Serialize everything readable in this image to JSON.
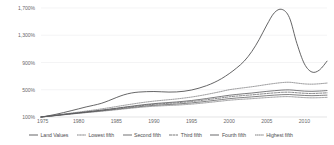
{
  "chart_data": {
    "type": "line",
    "title": "",
    "subtitle": "",
    "xlabel": "",
    "ylabel": "",
    "xlim": [
      1975,
      2013
    ],
    "ylim": [
      100,
      1700
    ],
    "grid": true,
    "legend_position": "bottom",
    "y_ticks": [
      "100%",
      "500%",
      "900%",
      "1,300%",
      "1,700%"
    ],
    "y_tick_values": [
      100,
      500,
      900,
      1300,
      1700
    ],
    "x_ticks": [
      "1975",
      "1980",
      "1985",
      "1990",
      "1995",
      "2000",
      "2005",
      "2010"
    ],
    "x_tick_values": [
      1975,
      1980,
      1985,
      1990,
      1995,
      2000,
      2005,
      2010
    ],
    "x": [
      1975,
      1976,
      1977,
      1978,
      1979,
      1980,
      1981,
      1982,
      1983,
      1984,
      1985,
      1986,
      1987,
      1988,
      1989,
      1990,
      1991,
      1992,
      1993,
      1994,
      1995,
      1996,
      1997,
      1998,
      1999,
      2000,
      2001,
      2002,
      2003,
      2004,
      2005,
      2006,
      2007,
      2008,
      2009,
      2010,
      2011,
      2012,
      2013
    ],
    "series": [
      {
        "name": "Land Values",
        "style": "solid",
        "color": "#4a4a4c",
        "values": [
          100,
          118,
          140,
          165,
          192,
          220,
          248,
          272,
          300,
          340,
          385,
          425,
          452,
          466,
          472,
          474,
          470,
          466,
          468,
          478,
          496,
          524,
          560,
          606,
          664,
          736,
          820,
          920,
          1060,
          1240,
          1450,
          1630,
          1680,
          1560,
          1180,
          880,
          760,
          790,
          920
        ]
      },
      {
        "name": "Lowest fifth",
        "style": "dotted-fine",
        "color": "#6f6f71",
        "values": [
          100,
          110,
          121,
          132,
          143,
          154,
          164,
          174,
          184,
          195,
          206,
          218,
          229,
          240,
          250,
          258,
          264,
          269,
          274,
          281,
          289,
          299,
          310,
          322,
          334,
          346,
          355,
          362,
          369,
          377,
          385,
          392,
          398,
          399,
          392,
          385,
          382,
          384,
          388
        ]
      },
      {
        "name": "Second fifth",
        "style": "solid",
        "color": "#58585a",
        "values": [
          100,
          111,
          122,
          134,
          146,
          157,
          168,
          179,
          190,
          202,
          214,
          227,
          239,
          251,
          262,
          271,
          278,
          284,
          290,
          298,
          307,
          318,
          330,
          343,
          356,
          369,
          379,
          387,
          395,
          404,
          413,
          421,
          428,
          430,
          423,
          416,
          413,
          416,
          421
        ]
      },
      {
        "name": "Third fifth",
        "style": "dashed",
        "color": "#5e5e60",
        "values": [
          100,
          112,
          124,
          137,
          149,
          161,
          173,
          185,
          197,
          210,
          224,
          238,
          251,
          264,
          276,
          286,
          294,
          301,
          308,
          317,
          327,
          339,
          353,
          367,
          381,
          396,
          407,
          416,
          425,
          435,
          445,
          454,
          462,
          464,
          456,
          448,
          445,
          449,
          455
        ]
      },
      {
        "name": "Fourth fifth",
        "style": "solid",
        "color": "#4f4f51",
        "values": [
          100,
          112,
          125,
          138,
          151,
          163,
          176,
          188,
          201,
          215,
          229,
          244,
          258,
          272,
          285,
          296,
          305,
          313,
          321,
          331,
          342,
          356,
          371,
          387,
          403,
          419,
          431,
          442,
          452,
          464,
          476,
          486,
          495,
          498,
          489,
          480,
          477,
          481,
          488
        ]
      },
      {
        "name": "Highest fifth",
        "style": "dotted",
        "color": "#6a6a6c",
        "values": [
          100,
          114,
          128,
          143,
          158,
          172,
          187,
          202,
          218,
          235,
          253,
          271,
          288,
          305,
          320,
          333,
          344,
          354,
          365,
          378,
          393,
          411,
          431,
          453,
          476,
          500,
          516,
          530,
          544,
          560,
          577,
          592,
          605,
          610,
          598,
          586,
          582,
          588,
          598
        ]
      }
    ]
  }
}
